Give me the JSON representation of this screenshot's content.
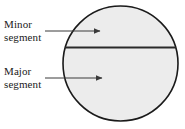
{
  "figure": {
    "background_color": "#ffffff"
  },
  "labels": {
    "minor": {
      "line1": "Minor",
      "line2": "segment"
    },
    "major": {
      "line1": "Major",
      "line2": "segment"
    }
  },
  "shapes": {
    "circle": {
      "name": "circle",
      "center_x": 120.5,
      "center_y": 63.5,
      "radius": 57.5,
      "fill_color": "#ececec",
      "stroke_color": "#1a1a1a",
      "stroke_width": 1.6
    },
    "chord": {
      "name": "chord",
      "y": 47.5,
      "x_start": 64,
      "x_end": 177,
      "stroke_color": "#2a2a2a",
      "stroke_width": 2.2
    }
  },
  "arrows": {
    "minor_pointer": {
      "x_start": 45,
      "y_start": 31,
      "x_end": 100,
      "y_end": 31,
      "stroke_color": "#3a3a3a",
      "stroke_width": 1
    },
    "major_pointer": {
      "x_start": 45,
      "y_start": 78,
      "x_end": 102,
      "y_end": 78,
      "stroke_color": "#3a3a3a",
      "stroke_width": 1
    }
  }
}
